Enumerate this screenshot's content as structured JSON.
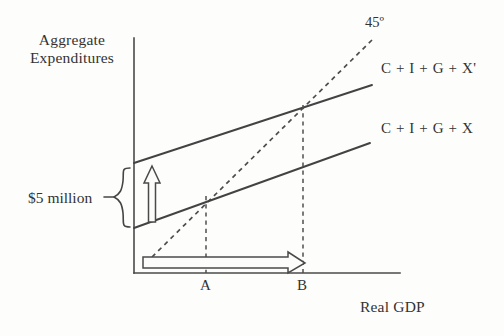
{
  "figure": {
    "kind": "keynesian-cross-aggregate-expenditures",
    "background_color": "#fdfdfc",
    "ink_color": "#434343"
  },
  "axes": {
    "y_title": "Aggregate\nExpenditures",
    "y_title_line1": "Aggregate",
    "y_title_line2": "Expenditures",
    "x_title": "Real GDP"
  },
  "labels": {
    "reference_line": "45º",
    "curve_upper": "C + I + G + X'",
    "curve_lower": "C + I + G + X",
    "shift_amount": "$5 million",
    "point_a": "A",
    "point_b": "B"
  },
  "chart_data": {
    "type": "line",
    "title": "",
    "xlabel": "Real GDP",
    "ylabel": "Aggregate Expenditures",
    "grid": false,
    "legend": "inline-right",
    "annotations": [
      {
        "name": "vertical-shift",
        "text": "$5 million",
        "direction": "up"
      },
      {
        "name": "horizontal-gdp-change",
        "text": "",
        "direction": "right",
        "from": "A",
        "to": "B"
      },
      {
        "name": "reference-angle",
        "text": "45º"
      }
    ],
    "series": [
      {
        "name": "C + I + G + X'",
        "style": "solid",
        "points": [
          {
            "x": 134,
            "y": 163
          },
          {
            "x": 372,
            "y": 85
          }
        ]
      },
      {
        "name": "C + I + G + X",
        "style": "solid",
        "points": [
          {
            "x": 134,
            "y": 228
          },
          {
            "x": 370,
            "y": 143
          }
        ]
      },
      {
        "name": "45º",
        "style": "dashed",
        "points": [
          {
            "x": 152,
            "y": 257
          },
          {
            "x": 372,
            "y": 40
          }
        ]
      }
    ],
    "equilibria": [
      {
        "label": "A",
        "x": 206,
        "y": 196,
        "on_series": "C + I + G + X"
      },
      {
        "label": "B",
        "x": 303,
        "y": 105,
        "on_series": "C + I + G + X'"
      }
    ],
    "axis_geometry": {
      "origin": {
        "x": 134,
        "y": 273
      },
      "y_axis_top": {
        "x": 134,
        "y": 38
      },
      "x_axis_right": {
        "x": 400,
        "y": 273
      }
    }
  }
}
